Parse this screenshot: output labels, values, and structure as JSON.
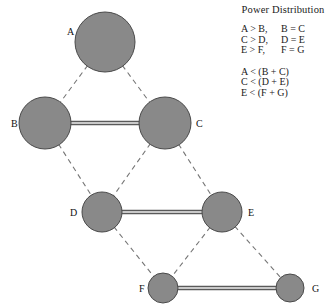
{
  "legend": {
    "title": "Power Distribution",
    "relations": [
      {
        "left": "A > B,",
        "right": "B = C"
      },
      {
        "left": "C > D,",
        "right": "D = E"
      },
      {
        "left": "E > F,",
        "right": "F = G"
      }
    ],
    "inequalities": [
      "A < (B + C)",
      "C < (D + E)",
      "E < (F + G)"
    ]
  },
  "diagram": {
    "node_fill": "#898989",
    "node_stroke": "#4a4a4a",
    "dashed_edge_color": "#767676",
    "solid_edge_color": "#5a5a5a",
    "nodes": [
      {
        "id": "A",
        "label": "A",
        "cx": 105,
        "cy": 42,
        "r": 30,
        "label_x": 67,
        "label_y": 35
      },
      {
        "id": "B",
        "label": "B",
        "cx": 45,
        "cy": 123,
        "r": 26,
        "label_x": 11,
        "label_y": 127
      },
      {
        "id": "C",
        "label": "C",
        "cx": 165,
        "cy": 123,
        "r": 26,
        "label_x": 196,
        "label_y": 127
      },
      {
        "id": "D",
        "label": "D",
        "cx": 102,
        "cy": 212,
        "r": 20,
        "label_x": 70,
        "label_y": 216
      },
      {
        "id": "E",
        "label": "E",
        "cx": 222,
        "cy": 212,
        "r": 20,
        "label_x": 248,
        "label_y": 216
      },
      {
        "id": "F",
        "label": "F",
        "cx": 163,
        "cy": 288,
        "r": 15,
        "label_x": 139,
        "label_y": 292
      },
      {
        "id": "G",
        "label": "G",
        "cx": 290,
        "cy": 288,
        "r": 14,
        "label_x": 312,
        "label_y": 292
      }
    ],
    "dashed_edges": [
      {
        "from": "A",
        "to": "B"
      },
      {
        "from": "A",
        "to": "C"
      },
      {
        "from": "B",
        "to": "D"
      },
      {
        "from": "C",
        "to": "D"
      },
      {
        "from": "C",
        "to": "E"
      },
      {
        "from": "D",
        "to": "F"
      },
      {
        "from": "E",
        "to": "F"
      },
      {
        "from": "E",
        "to": "G"
      }
    ],
    "solid_edges": [
      {
        "from": "B",
        "to": "C"
      },
      {
        "from": "D",
        "to": "E"
      },
      {
        "from": "F",
        "to": "G"
      }
    ]
  }
}
